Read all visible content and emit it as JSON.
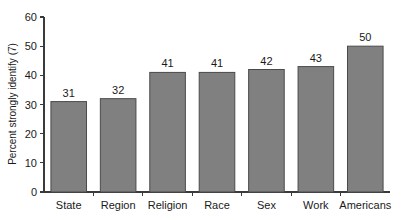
{
  "chart_data": {
    "type": "bar",
    "title": "",
    "subtitle": "",
    "xlabel": "",
    "ylabel": "Percent strongly identify (7)",
    "categories": [
      "State",
      "Region",
      "Religion",
      "Race",
      "Sex",
      "Work",
      "Americans"
    ],
    "values": [
      31,
      32,
      41,
      41,
      42,
      43,
      50
    ],
    "value_labels": [
      "31",
      "32",
      "41",
      "41",
      "42",
      "43",
      "50"
    ],
    "ylim": [
      0,
      60
    ],
    "ytick_values": [
      0,
      10,
      20,
      30,
      40,
      50,
      60
    ],
    "ytick_labels": [
      "0",
      "10",
      "20",
      "30",
      "40",
      "50",
      "60"
    ],
    "grid": false,
    "legend": false,
    "legend_position": "none",
    "bar_fill_color": "#808080",
    "bar_edge_color": "#4a4a4a",
    "axis_color": "#3a3a3a",
    "background_color": "#ffffff",
    "text_color": "#1a1a1a",
    "show_value_labels": true,
    "x_tick_marks_between_categories": true
  }
}
